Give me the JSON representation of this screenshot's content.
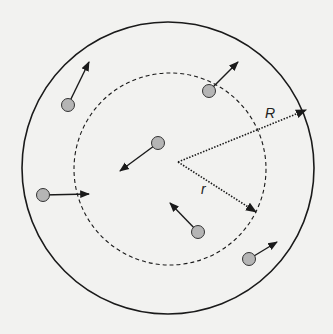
{
  "diagram": {
    "colors": {
      "background": "#f2f2f0",
      "stroke": "#1a1a1a",
      "particle_fill": "#b5b5b5",
      "particle_stroke": "#333333"
    },
    "outer_circle": {
      "label": "R",
      "style": "solid"
    },
    "inner_circle": {
      "label": "r",
      "style": "dashed"
    },
    "radius_lines": [
      {
        "name": "outer-radius",
        "label": "R",
        "style": "dotted"
      },
      {
        "name": "inner-radius",
        "label": "r",
        "style": "dotted"
      }
    ],
    "particles": [
      {
        "id": 1,
        "direction": "up-right"
      },
      {
        "id": 2,
        "direction": "up-right"
      },
      {
        "id": 3,
        "direction": "down-left"
      },
      {
        "id": 4,
        "direction": "right"
      },
      {
        "id": 5,
        "direction": "up-left"
      },
      {
        "id": 6,
        "direction": "up-right"
      }
    ]
  }
}
